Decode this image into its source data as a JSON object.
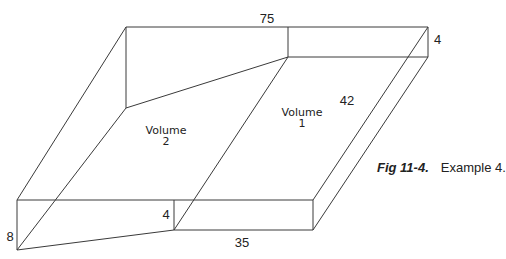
{
  "figure": {
    "number": "Fig 11-4.",
    "title": "Example 4."
  },
  "dimensions": {
    "length_top": "75",
    "height_right": "4",
    "depth": "42",
    "height_left": "8",
    "height_middle": "4",
    "length_bottom": "35"
  },
  "volumes": [
    {
      "line1": "Volume",
      "line2": "1"
    },
    {
      "line1": "Volume",
      "line2": "2"
    }
  ],
  "colors": {
    "line": "#3a3a3a",
    "text": "#222222",
    "background": "#ffffff"
  }
}
